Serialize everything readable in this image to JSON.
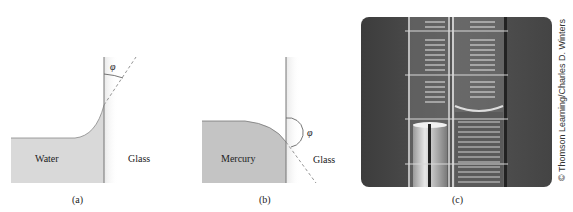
{
  "panels": [
    {
      "id": "a",
      "caption": "(a)",
      "liquid_label": "Water",
      "solid_label": "Glass",
      "angle_symbol": "φ",
      "meniscus": "concave (wetting)"
    },
    {
      "id": "b",
      "caption": "(b)",
      "liquid_label": "Mercury",
      "solid_label": "Glass",
      "angle_symbol": "φ",
      "meniscus": "convex (non-wetting)"
    },
    {
      "id": "c",
      "caption": "(c)",
      "photo_description": "Two graduated glass tubes side by side showing mercury (convex meniscus) and water (concave meniscus)",
      "credit": "© Thomson Learning/Charles D. Winters"
    }
  ],
  "colors": {
    "liquid_water": "#d9d9d9",
    "liquid_mercury": "#c4c4c4",
    "glass_line": "#777777",
    "dashed_line": "#888888",
    "photo_bg": "#4a4a4a"
  }
}
